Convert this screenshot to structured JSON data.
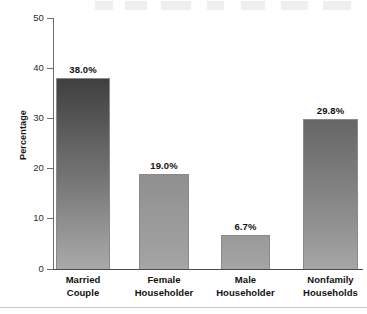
{
  "chart_data": {
    "type": "bar",
    "title": "",
    "subtitle": "",
    "xlabel": "",
    "ylabel": "Percentage",
    "ylim": [
      0,
      50
    ],
    "yticks": [
      0,
      10,
      20,
      30,
      40,
      50
    ],
    "ytick_labels": [
      "0",
      "10",
      "20",
      "30",
      "40",
      "50"
    ],
    "grid": false,
    "legend": null,
    "categories": [
      "Married Couple",
      "Female Householder",
      "Male Householder",
      "Nonfamily Households"
    ],
    "category_lines": [
      [
        "Married",
        "Couple"
      ],
      [
        "Female",
        "Householder"
      ],
      [
        "Male",
        "Householder"
      ],
      [
        "Nonfamily",
        "Households"
      ]
    ],
    "values": [
      38.0,
      19.0,
      6.7,
      29.8
    ],
    "data_labels": [
      "38.0%",
      "19.0%",
      "6.7%",
      "29.8%"
    ],
    "bar_colors_top": [
      "#3f3f3f",
      "#8f8f8f",
      "#9a9a9a",
      "#676767"
    ],
    "bar_colors_bottom": [
      "#a9a9a9",
      "#a6a6a6",
      "#a5a5a5",
      "#a6a6a6"
    ],
    "bar_border_color": "#8a8a8a",
    "axis_color": "#4a4a4a",
    "background_color": "#ffffff",
    "text_color": "#111111"
  }
}
